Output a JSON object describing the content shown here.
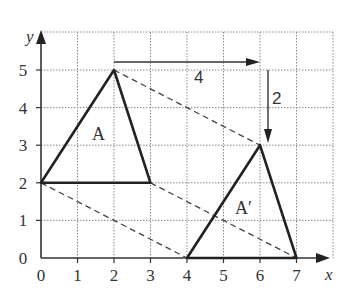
{
  "diagram": {
    "axes": {
      "x_label": "x",
      "y_label": "y",
      "x_ticks": [
        "0",
        "1",
        "2",
        "3",
        "4",
        "5",
        "6",
        "7"
      ],
      "y_ticks": [
        "0",
        "1",
        "2",
        "3",
        "4",
        "5"
      ]
    },
    "shapes": {
      "original": {
        "label": "A",
        "vertices": [
          [
            0,
            2
          ],
          [
            2,
            5
          ],
          [
            3,
            2
          ]
        ]
      },
      "image": {
        "label": "A′",
        "vertices": [
          [
            4,
            0
          ],
          [
            6,
            3
          ],
          [
            7,
            0
          ]
        ]
      }
    },
    "translation": {
      "horizontal_label": "4",
      "vertical_label": "2"
    },
    "colors": {
      "lines": "#222222",
      "grid": "#888888",
      "text": "#333333"
    }
  }
}
